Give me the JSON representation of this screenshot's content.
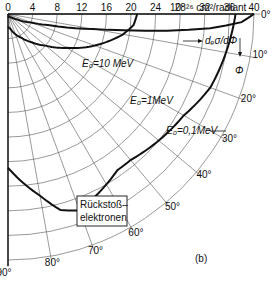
{
  "chart_data": {
    "type": "polar-line",
    "title": "",
    "unit_label": "10⁻²⁶ cm²/radiant",
    "radial_axis_label": "dₑσ/dΦ",
    "angle_axis_label": "Φ",
    "radial_ticks": [
      0,
      4,
      8,
      12,
      16,
      20,
      24,
      28,
      32,
      36,
      40
    ],
    "angle_ticks_deg": [
      0,
      10,
      20,
      30,
      40,
      50,
      60,
      70,
      80,
      90
    ],
    "angle_tick_labels": [
      "0°",
      "10°",
      "20°",
      "30°",
      "40°",
      "50°",
      "60°",
      "70°",
      "80°",
      "90°"
    ],
    "rlim": [
      0,
      40
    ],
    "grid": true,
    "series": [
      {
        "name": "E₀=10 MeV",
        "angles_deg": [
          0,
          2,
          4,
          6,
          8,
          10,
          15,
          20,
          30,
          40,
          60,
          90
        ],
        "values": [
          40,
          38,
          33,
          26,
          19,
          14,
          7,
          4,
          1.8,
          1,
          0.5,
          0.3
        ]
      },
      {
        "name": "E₀=1 MeV",
        "angles_deg": [
          0,
          5,
          10,
          15,
          20,
          25,
          30,
          40,
          50,
          60,
          70,
          80,
          90
        ],
        "values": [
          21,
          20.5,
          19,
          17,
          15,
          13,
          11,
          8,
          6,
          4.5,
          3.5,
          2.5,
          2
        ]
      },
      {
        "name": "E₀=0.1 MeV",
        "angles_deg": [
          0,
          10,
          20,
          30,
          40,
          50,
          55,
          60,
          65,
          70,
          75,
          80,
          90
        ],
        "values": [
          37,
          36,
          35,
          33,
          32,
          31,
          31,
          32,
          33,
          34,
          33,
          30,
          25
        ]
      }
    ],
    "annotations": [
      "E₀=10 MeV",
      "E₀=1MeV",
      "E₀=0,1MeV",
      "Rückstoß–elektronen",
      "(b)"
    ]
  },
  "labels": {
    "unit": "10⁻²⁶ cm²/radiant",
    "sigma": "dₑσ/dΦ",
    "phi": "Φ",
    "e10": "E₀=10 MeV",
    "e1": "E₀=1MeV",
    "e01": "E₀=0,1MeV",
    "box1": "Rückstoß–",
    "box2": "elektronen",
    "panel": "(b)"
  }
}
